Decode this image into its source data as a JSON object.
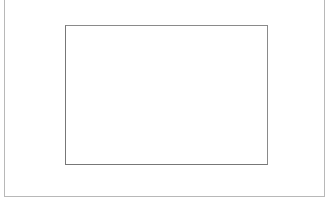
{
  "chart_data": {
    "type": "bar",
    "title": "",
    "xlabel": "(연도)",
    "ylabel": "(%)",
    "categories": [
      "2001",
      "2002",
      "2003",
      "2004",
      "2005",
      "2006"
    ],
    "values": [
      48.3,
      56.7,
      62.2,
      65.9,
      77.5,
      71.3
    ],
    "value_labels": [
      "48,3",
      "56,7",
      "62,2",
      "65,9",
      "77,5",
      "71,3"
    ],
    "ylim": [
      0,
      90
    ],
    "yticks": [
      "0",
      "10",
      "20",
      "30",
      "40",
      "50",
      "60",
      "70",
      "80",
      "90"
    ],
    "grid": false,
    "legend": null,
    "colors": {
      "bar_fill": "#d9d9d9",
      "bar_border": "#7f7f7f",
      "axis": "#777777"
    }
  }
}
